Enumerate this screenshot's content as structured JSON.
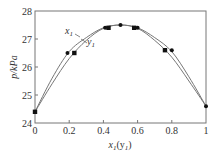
{
  "chart_data": {
    "type": "line",
    "title": "",
    "xlabel": "x1(y1)",
    "ylabel": "p/kPa",
    "xlim": [
      0,
      1
    ],
    "ylim": [
      24,
      28
    ],
    "xticks": [
      0,
      0.2,
      0.4,
      0.6,
      0.8,
      1
    ],
    "xtick_labels": [
      "0",
      "0.2",
      "0.4",
      "0.6",
      "0.8",
      "1"
    ],
    "yticks": [
      24,
      25,
      26,
      27,
      28
    ],
    "ytick_labels": [
      "24",
      "25",
      "26",
      "27",
      "28"
    ],
    "grid": false,
    "legend": "inline curve labels",
    "series": [
      {
        "name": "x1",
        "marker": "circle",
        "curve": [
          [
            0,
            24.4
          ],
          [
            0.1,
            25.6
          ],
          [
            0.2,
            26.55
          ],
          [
            0.3,
            27.05
          ],
          [
            0.4,
            27.4
          ],
          [
            0.5,
            27.5
          ],
          [
            0.6,
            27.4
          ],
          [
            0.7,
            27.05
          ],
          [
            0.8,
            26.55
          ],
          [
            0.9,
            25.65
          ],
          [
            1.0,
            24.6
          ]
        ],
        "points": [
          [
            0.19,
            26.5
          ],
          [
            0.41,
            27.4
          ],
          [
            0.5,
            27.5
          ],
          [
            0.6,
            27.4
          ],
          [
            0.8,
            26.6
          ],
          [
            1.0,
            24.6
          ]
        ]
      },
      {
        "name": "y1",
        "marker": "square",
        "curve": [
          [
            0,
            24.4
          ],
          [
            0.1,
            25.4
          ],
          [
            0.2,
            26.3
          ],
          [
            0.3,
            26.95
          ],
          [
            0.4,
            27.38
          ],
          [
            0.5,
            27.5
          ],
          [
            0.6,
            27.38
          ],
          [
            0.7,
            26.95
          ],
          [
            0.8,
            26.35
          ],
          [
            0.9,
            25.5
          ],
          [
            1.0,
            24.6
          ]
        ],
        "points": [
          [
            0.0,
            24.4
          ],
          [
            0.23,
            26.5
          ],
          [
            0.43,
            27.4
          ],
          [
            0.58,
            27.4
          ],
          [
            0.76,
            26.6
          ]
        ]
      }
    ],
    "annotations": [
      {
        "text": "x1",
        "x": 0.13,
        "y": 27.15
      },
      {
        "text": "y1",
        "x": 0.23,
        "y": 26.85
      }
    ]
  },
  "labels": {
    "ylabel": "p/kPa",
    "xlabel_main": "x",
    "xlabel_sub1": "1",
    "xlabel_paren_open": "(y",
    "xlabel_sub2": "1",
    "xlabel_paren_close": ")",
    "curve_x": "x",
    "curve_x_sub": "1",
    "curve_y": "y",
    "curve_y_sub": "1"
  }
}
